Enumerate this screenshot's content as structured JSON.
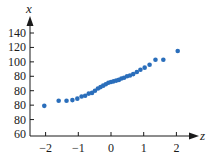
{
  "chart_data": {
    "type": "scatter",
    "title": "",
    "xlabel": "z",
    "ylabel": "x",
    "x_ticks": [
      -2,
      -1,
      0,
      1,
      2
    ],
    "x_tick_labels": [
      "−2",
      "−1",
      "0",
      "1",
      "2"
    ],
    "y_tick_labels": [
      "60",
      "80",
      "80",
      "80",
      "80",
      "100",
      "120",
      "140"
    ],
    "y_tick_positions_nominal": [
      60,
      80,
      100,
      120,
      140,
      160,
      180,
      200
    ],
    "xlim": [
      -2.5,
      2.6
    ],
    "ylim": [
      60,
      210
    ],
    "grid": false,
    "legend": null,
    "marker_color": "#2a6ebb",
    "series": [
      {
        "name": "normal quantile plot",
        "points": [
          {
            "z": -2.04,
            "x": 99
          },
          {
            "z": -1.6,
            "x": 106
          },
          {
            "z": -1.36,
            "x": 106
          },
          {
            "z": -1.18,
            "x": 107
          },
          {
            "z": -1.03,
            "x": 109
          },
          {
            "z": -0.9,
            "x": 112
          },
          {
            "z": -0.79,
            "x": 113
          },
          {
            "z": -0.68,
            "x": 116
          },
          {
            "z": -0.58,
            "x": 117
          },
          {
            "z": -0.49,
            "x": 120
          },
          {
            "z": -0.4,
            "x": 123
          },
          {
            "z": -0.32,
            "x": 125
          },
          {
            "z": -0.24,
            "x": 127
          },
          {
            "z": -0.16,
            "x": 129
          },
          {
            "z": -0.08,
            "x": 131
          },
          {
            "z": 0.0,
            "x": 132
          },
          {
            "z": 0.08,
            "x": 133
          },
          {
            "z": 0.16,
            "x": 134
          },
          {
            "z": 0.24,
            "x": 135
          },
          {
            "z": 0.32,
            "x": 137
          },
          {
            "z": 0.4,
            "x": 138
          },
          {
            "z": 0.49,
            "x": 140
          },
          {
            "z": 0.58,
            "x": 141
          },
          {
            "z": 0.68,
            "x": 143
          },
          {
            "z": 0.79,
            "x": 146
          },
          {
            "z": 0.9,
            "x": 149
          },
          {
            "z": 1.03,
            "x": 152
          },
          {
            "z": 1.18,
            "x": 156
          },
          {
            "z": 1.36,
            "x": 163
          },
          {
            "z": 1.6,
            "x": 163
          },
          {
            "z": 2.04,
            "x": 175
          }
        ]
      }
    ]
  },
  "plot": {
    "origin_px": {
      "x": 30,
      "y": 134
    },
    "x_axis_y_px": 136,
    "z_zero_px": 111,
    "px_per_z": 32.7,
    "px_per_y_unit": 0.7214,
    "y_axis_top_px": 22,
    "x_axis_right_px": 197,
    "marker_radius": 2.3
  }
}
